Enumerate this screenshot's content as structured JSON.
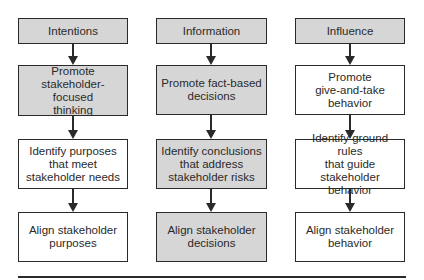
{
  "diagram": {
    "colors": {
      "shaded": "#d6d6d6",
      "plain": "#ffffff",
      "stroke": "#2a2a2a"
    },
    "columns": [
      {
        "header": "Intentions",
        "boxes": [
          {
            "text": "Intentions",
            "shaded": true
          },
          {
            "text": "Promote stakeholder-focused thinking",
            "lines": [
              "Promote",
              "stakeholder-focused",
              "thinking"
            ],
            "shaded": true
          },
          {
            "text": "Identify purposes that meet stakeholder needs",
            "lines": [
              "Identify purposes",
              "that meet",
              "stakeholder needs"
            ],
            "shaded": false
          },
          {
            "text": "Align stakeholder purposes",
            "lines": [
              "Align stakeholder",
              "purposes"
            ],
            "shaded": false
          }
        ]
      },
      {
        "header": "Information",
        "boxes": [
          {
            "text": "Information",
            "shaded": true
          },
          {
            "text": "Promote fact-based decisions",
            "lines": [
              "Promote fact-based",
              "decisions"
            ],
            "shaded": true
          },
          {
            "text": "Identify conclusions that address stakeholder risks",
            "lines": [
              "Identify conclusions",
              "that address",
              "stakeholder risks"
            ],
            "shaded": true
          },
          {
            "text": "Align stakeholder decisions",
            "lines": [
              "Align stakeholder",
              "decisions"
            ],
            "shaded": true
          }
        ]
      },
      {
        "header": "Influence",
        "boxes": [
          {
            "text": "Influence",
            "shaded": true
          },
          {
            "text": "Promote give-and-take behavior",
            "lines": [
              "Promote",
              "give-and-take",
              "behavior"
            ],
            "shaded": false
          },
          {
            "text": "Identify ground rules that guide stakeholder behavior",
            "lines": [
              "Identify ground rules",
              "that guide",
              "stakeholder behavior"
            ],
            "shaded": false
          },
          {
            "text": "Align stakeholder behavior",
            "lines": [
              "Align stakeholder",
              "behavior"
            ],
            "shaded": false
          }
        ]
      }
    ],
    "edges": [
      {
        "from": "Intentions",
        "to": "Promote stakeholder-focused thinking"
      },
      {
        "from": "Promote stakeholder-focused thinking",
        "to": "Identify purposes that meet stakeholder needs"
      },
      {
        "from": "Identify purposes that meet stakeholder needs",
        "to": "Align stakeholder purposes"
      },
      {
        "from": "Information",
        "to": "Promote fact-based decisions"
      },
      {
        "from": "Promote fact-based decisions",
        "to": "Identify conclusions that address stakeholder risks"
      },
      {
        "from": "Identify conclusions that address stakeholder risks",
        "to": "Align stakeholder decisions"
      },
      {
        "from": "Influence",
        "to": "Promote give-and-take behavior"
      },
      {
        "from": "Promote give-and-take behavior",
        "to": "Identify ground rules that guide stakeholder behavior"
      },
      {
        "from": "Identify ground rules that guide stakeholder behavior",
        "to": "Align stakeholder behavior"
      }
    ]
  }
}
